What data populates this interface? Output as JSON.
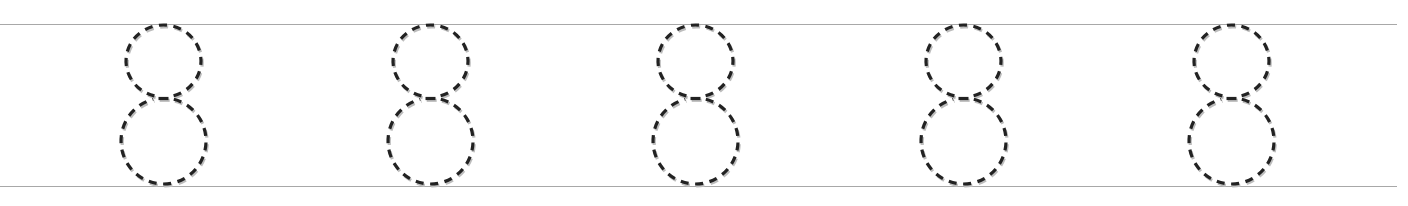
{
  "worksheet": {
    "type": "tracing-row",
    "character": "8",
    "repetitions": 5,
    "stroke_style": "dashed",
    "colors": {
      "stroke": "#222222",
      "shadow": "#bdbdbd",
      "guide_line": "#a8a8a8",
      "background": "#ffffff"
    },
    "guide_lines": [
      {
        "name": "top-guide-line",
        "y": 24
      },
      {
        "name": "bottom-guide-line",
        "y": 186
      }
    ],
    "digits": [
      {
        "label": "8",
        "center_x": 163
      },
      {
        "label": "8",
        "center_x": 430
      },
      {
        "label": "8",
        "center_x": 695
      },
      {
        "label": "8",
        "center_x": 963
      },
      {
        "label": "8",
        "center_x": 1231
      }
    ]
  }
}
